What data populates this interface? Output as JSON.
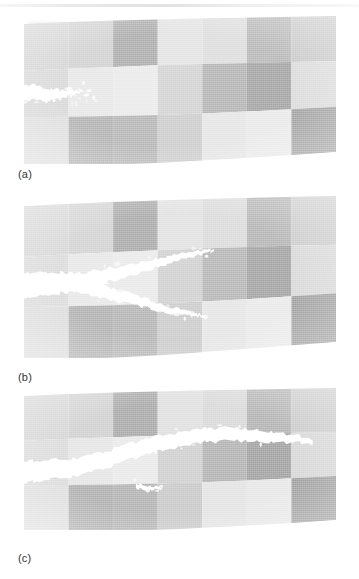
{
  "figure": {
    "kind": "scanned-grayscale-figure",
    "caption_style": "lettered-panels",
    "background_color": "#ffffff",
    "panels": [
      {
        "id": "a",
        "label": "(a)",
        "label_x": 18,
        "label_y": 168,
        "bounds": {
          "x": 24,
          "y": 16,
          "width": 312,
          "height": 148
        },
        "description": "Initial notch; short jagged crack just starting from the left edge",
        "skew": {
          "top_left_dy": 8,
          "top_right_dy": 0,
          "bottom_left_dy": 0,
          "bottom_right_dy": -12
        },
        "grid": {
          "columns": 7,
          "rows": 3,
          "tones": [
            [
              "#d2d2d2",
              "#cfcfcf",
              "#a8a8a8",
              "#e2e2e2",
              "#dcdcdc",
              "#b4b4b4",
              "#c6c6c6"
            ],
            [
              "#d6d6d6",
              "#e6e6e6",
              "#e9e9e9",
              "#d0d0d0",
              "#b0b0b0",
              "#9f9f9f",
              "#dadada"
            ],
            [
              "#dcdcdc",
              "#aeaeae",
              "#b2b2b2",
              "#cacaca",
              "#e4e4e4",
              "#e8e8e8",
              "#9c9c9c"
            ]
          ]
        },
        "crack": {
          "stage": "initiation",
          "branches": 1,
          "entry_edge": "left",
          "tip_fraction_of_width": 0.18,
          "color": "#ffffff"
        }
      },
      {
        "id": "b",
        "label": "(b)",
        "label_x": 18,
        "label_y": 371,
        "bounds": {
          "x": 24,
          "y": 196,
          "width": 312,
          "height": 162
        },
        "description": "Crack has branched into an upper and a lower arm propagating to the right",
        "skew": {
          "top_left_dy": 10,
          "top_right_dy": 0,
          "bottom_left_dy": 0,
          "bottom_right_dy": -16
        },
        "grid": {
          "columns": 7,
          "rows": 3,
          "tones": [
            [
              "#d4d4d4",
              "#d0d0d0",
              "#a6a6a6",
              "#e0e0e0",
              "#d8d8d8",
              "#b0b0b0",
              "#c8c8c8"
            ],
            [
              "#d8d8d8",
              "#e6e6e6",
              "#e8e8e8",
              "#cecece",
              "#b2b2b2",
              "#9d9d9d",
              "#d6d6d6"
            ],
            [
              "#dadada",
              "#acacac",
              "#b0b0b0",
              "#c8c8c8",
              "#e4e4e4",
              "#e8e8e8",
              "#9a9a9a"
            ]
          ]
        },
        "crack": {
          "stage": "branching",
          "branches": 2,
          "entry_edge": "left",
          "tip_fraction_of_width": 0.62,
          "color": "#ffffff"
        }
      },
      {
        "id": "c",
        "label": "(c)",
        "label_x": 18,
        "label_y": 552,
        "bounds": {
          "x": 24,
          "y": 388,
          "width": 312,
          "height": 142
        },
        "description": "Single dominant crack has arced upward and run nearly across the full specimen",
        "skew": {
          "top_left_dy": 8,
          "top_right_dy": 0,
          "bottom_left_dy": 0,
          "bottom_right_dy": -10
        },
        "grid": {
          "columns": 7,
          "rows": 3,
          "tones": [
            [
              "#d2d2d2",
              "#cecece",
              "#a4a4a4",
              "#dedede",
              "#d6d6d6",
              "#aeaeae",
              "#c6c6c6"
            ],
            [
              "#d8d8d8",
              "#e4e4e4",
              "#e8e8e8",
              "#cccccc",
              "#aeaeae",
              "#9b9b9b",
              "#d4d4d4"
            ],
            [
              "#dcdcdc",
              "#aaaaaa",
              "#aeaeae",
              "#c6c6c6",
              "#e2e2e2",
              "#e6e6e6",
              "#989898"
            ]
          ]
        },
        "crack": {
          "stage": "propagated",
          "branches": 1,
          "entry_edge": "left",
          "tip_fraction_of_width": 0.92,
          "color": "#ffffff"
        }
      }
    ]
  }
}
